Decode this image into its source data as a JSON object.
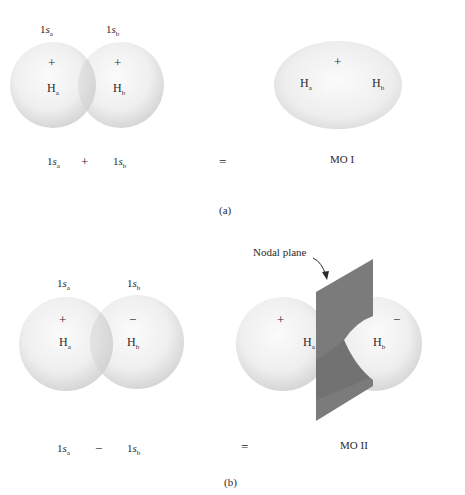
{
  "panel_a": {
    "caption": "(a)",
    "left_orbitals": {
      "orbital_a_label": "1s",
      "orbital_a_sub": "a",
      "orbital_b_label": "1s",
      "orbital_b_sub": "b",
      "atom_a_sign": "+",
      "atom_b_sign": "+",
      "atom_a": "H",
      "atom_a_sub": "a",
      "atom_b": "H",
      "atom_b_sub": "b"
    },
    "equation": {
      "term1": "1s",
      "term1_sub": "a",
      "operator": "+",
      "term2": "1s",
      "term2_sub": "b",
      "equals": "="
    },
    "result": {
      "sign": "+",
      "atom_a": "H",
      "atom_a_sub": "a",
      "atom_b": "H",
      "atom_b_sub": "b",
      "label": "MO I"
    }
  },
  "panel_b": {
    "caption": "(b)",
    "left_orbitals": {
      "orbital_a_label": "1s",
      "orbital_a_sub": "a",
      "orbital_b_label": "1s",
      "orbital_b_sub": "b",
      "atom_a_sign": "+",
      "atom_b_sign": "−",
      "atom_a": "H",
      "atom_a_sub": "a",
      "atom_b": "H",
      "atom_b_sub": "b"
    },
    "equation": {
      "term1": "1s",
      "term1_sub": "a",
      "operator": "−",
      "term2": "1s",
      "term2_sub": "b",
      "equals": "="
    },
    "result": {
      "sign_a": "+",
      "sign_b": "−",
      "atom_a": "H",
      "atom_a_sub": "a",
      "atom_b": "H",
      "atom_b_sub": "b",
      "label": "MO II",
      "annotation": "Nodal plane"
    }
  },
  "colors": {
    "sphere_light": "#f7f7f7",
    "sphere_shadow": "#d9d9d9",
    "nodal_plane": "#7a7a7a",
    "text": "#2a2a2a"
  }
}
